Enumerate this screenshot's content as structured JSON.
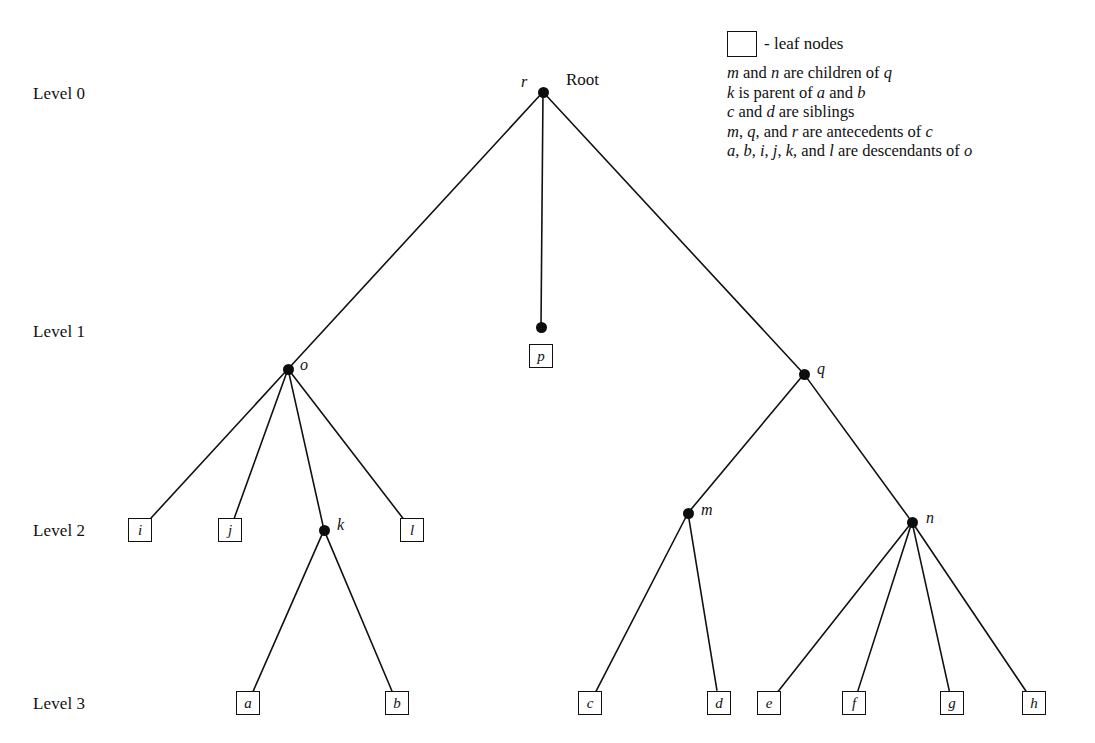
{
  "diagram": {
    "background_color": "#ffffff",
    "ink_color": "#111111"
  },
  "levels": [
    {
      "label": "Level 0",
      "x": 33,
      "y": 84
    },
    {
      "label": "Level 1",
      "x": 33,
      "y": 322
    },
    {
      "label": "Level 2",
      "x": 33,
      "y": 521
    },
    {
      "label": "Level 3",
      "x": 33,
      "y": 694
    }
  ],
  "root_annotation": {
    "label": "Root",
    "x": 566,
    "y": 70
  },
  "legend": {
    "swatch_caption": "- leaf nodes",
    "notes": [
      "m and n are children of q",
      "k is parent of a and b",
      "c and d are siblings",
      "m, q, and r are antecedents of c",
      "a, b, i, j, k, and l are descendants of o"
    ]
  },
  "tree_data": {
    "type": "tree",
    "root": "r",
    "nodes": [
      {
        "id": "r",
        "label": "r",
        "level": 0,
        "x": 543,
        "y": 92,
        "kind": "internal",
        "label_x": 521,
        "label_y": 73
      },
      {
        "id": "o",
        "label": "o",
        "level": 1,
        "x": 288,
        "y": 369,
        "kind": "internal",
        "label_x": 300,
        "label_y": 356
      },
      {
        "id": "p",
        "label": "p",
        "level": 1,
        "x": 541,
        "y": 327,
        "kind": "internal-with-leaf",
        "label_x": 0,
        "label_y": 0
      },
      {
        "id": "q",
        "label": "q",
        "level": 1,
        "x": 804,
        "y": 374,
        "kind": "internal",
        "label_x": 817,
        "label_y": 360
      },
      {
        "id": "i",
        "label": "i",
        "level": 2,
        "x": 140,
        "y": 530,
        "kind": "leaf"
      },
      {
        "id": "j",
        "label": "j",
        "level": 2,
        "x": 230,
        "y": 530,
        "kind": "leaf"
      },
      {
        "id": "k",
        "label": "k",
        "level": 2,
        "x": 324,
        "y": 530,
        "kind": "internal",
        "label_x": 337,
        "label_y": 516
      },
      {
        "id": "l",
        "label": "l",
        "level": 2,
        "x": 412,
        "y": 530,
        "kind": "leaf"
      },
      {
        "id": "m",
        "label": "m",
        "level": 2,
        "x": 688,
        "y": 513,
        "kind": "internal",
        "label_x": 701,
        "label_y": 501
      },
      {
        "id": "n",
        "label": "n",
        "level": 2,
        "x": 912,
        "y": 522,
        "kind": "internal",
        "label_x": 926,
        "label_y": 509
      },
      {
        "id": "a",
        "label": "a",
        "level": 3,
        "x": 248,
        "y": 703,
        "kind": "leaf"
      },
      {
        "id": "b",
        "label": "b",
        "level": 3,
        "x": 397,
        "y": 703,
        "kind": "leaf"
      },
      {
        "id": "c",
        "label": "c",
        "level": 3,
        "x": 590,
        "y": 703,
        "kind": "leaf"
      },
      {
        "id": "d",
        "label": "d",
        "level": 3,
        "x": 719,
        "y": 703,
        "kind": "leaf"
      },
      {
        "id": "e",
        "label": "e",
        "level": 3,
        "x": 769,
        "y": 703,
        "kind": "leaf"
      },
      {
        "id": "f",
        "label": "f",
        "level": 3,
        "x": 854,
        "y": 703,
        "kind": "leaf"
      },
      {
        "id": "g",
        "label": "g",
        "level": 3,
        "x": 952,
        "y": 703,
        "kind": "leaf"
      },
      {
        "id": "h",
        "label": "h",
        "level": 3,
        "x": 1034,
        "y": 703,
        "kind": "leaf"
      }
    ],
    "leaf_nodes": [
      "p",
      "i",
      "j",
      "l",
      "a",
      "b",
      "c",
      "d",
      "e",
      "f",
      "g",
      "h"
    ],
    "edges": [
      {
        "from": "r",
        "to": "o"
      },
      {
        "from": "r",
        "to": "p"
      },
      {
        "from": "r",
        "to": "q"
      },
      {
        "from": "o",
        "to": "i"
      },
      {
        "from": "o",
        "to": "j"
      },
      {
        "from": "o",
        "to": "k"
      },
      {
        "from": "o",
        "to": "l"
      },
      {
        "from": "k",
        "to": "a"
      },
      {
        "from": "k",
        "to": "b"
      },
      {
        "from": "q",
        "to": "m"
      },
      {
        "from": "q",
        "to": "n"
      },
      {
        "from": "m",
        "to": "c"
      },
      {
        "from": "m",
        "to": "d"
      },
      {
        "from": "n",
        "to": "e"
      },
      {
        "from": "n",
        "to": "f"
      },
      {
        "from": "n",
        "to": "g"
      },
      {
        "from": "n",
        "to": "h"
      }
    ]
  }
}
